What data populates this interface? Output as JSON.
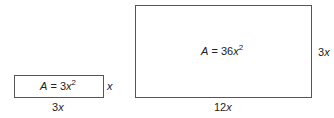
{
  "small_rectangle": {
    "area_prefix": "A",
    "area_eq": " = 3",
    "area_var": "x",
    "area_exp": "2",
    "width_coef": "3",
    "width_var": "x",
    "height_coef": "",
    "height_var": "x"
  },
  "large_rectangle": {
    "area_prefix": "A",
    "area_eq": " = 36",
    "area_var": "x",
    "area_exp": "2",
    "width_coef": "12",
    "width_var": "x",
    "height_coef": "3",
    "height_var": "x"
  }
}
